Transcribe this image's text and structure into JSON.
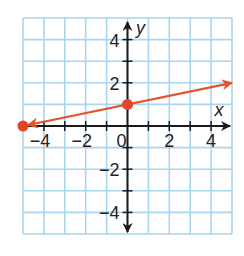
{
  "chart_data": {
    "type": "line",
    "title": "",
    "xlabel": "x",
    "ylabel": "y",
    "xlim": [
      -5,
      5
    ],
    "ylim": [
      -5,
      5
    ],
    "grid": true,
    "x_ticks": [
      -4,
      -2,
      0,
      2,
      4
    ],
    "y_ticks": [
      4,
      2,
      -2,
      -4
    ],
    "x_tick_labels": [
      "−4",
      "−2",
      "0",
      "2",
      "4"
    ],
    "y_tick_labels": [
      "4",
      "2",
      "−2",
      "−4"
    ],
    "series": [
      {
        "name": "line",
        "equation": "y = x/5 + 1",
        "slope": 0.2,
        "intercept": 1,
        "x": [
          -5,
          0,
          5
        ],
        "y": [
          0,
          1,
          2
        ],
        "points_marked": [
          [
            -5,
            0
          ],
          [
            0,
            1
          ]
        ],
        "arrows": "both"
      }
    ]
  },
  "colors": {
    "grid": "#a9d5ef",
    "axis": "#1a1a1a",
    "line": "#e4532e",
    "point": "#e4452a"
  },
  "labels": {
    "x_axis": "x",
    "y_axis": "y",
    "origin": "0"
  }
}
